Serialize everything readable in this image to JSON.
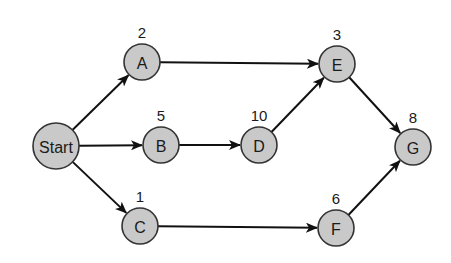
{
  "diagram": {
    "type": "activity-network",
    "nodes": [
      {
        "id": "start",
        "label": "Start",
        "duration": "",
        "x": 56,
        "y": 146,
        "r": 23
      },
      {
        "id": "A",
        "label": "A",
        "duration": "2",
        "x": 142,
        "y": 62,
        "r": 18
      },
      {
        "id": "B",
        "label": "B",
        "duration": "5",
        "x": 161,
        "y": 145,
        "r": 18
      },
      {
        "id": "C",
        "label": "C",
        "duration": "1",
        "x": 140,
        "y": 226,
        "r": 18
      },
      {
        "id": "D",
        "label": "D",
        "duration": "10",
        "x": 259,
        "y": 145,
        "r": 18
      },
      {
        "id": "E",
        "label": "E",
        "duration": "3",
        "x": 337,
        "y": 64,
        "r": 18
      },
      {
        "id": "F",
        "label": "F",
        "duration": "6",
        "x": 336,
        "y": 228,
        "r": 18
      },
      {
        "id": "G",
        "label": "G",
        "duration": "8",
        "x": 413,
        "y": 147,
        "r": 18
      }
    ],
    "edges": [
      {
        "from": "start",
        "to": "A"
      },
      {
        "from": "start",
        "to": "B"
      },
      {
        "from": "start",
        "to": "C"
      },
      {
        "from": "A",
        "to": "E"
      },
      {
        "from": "B",
        "to": "D"
      },
      {
        "from": "D",
        "to": "E"
      },
      {
        "from": "C",
        "to": "F"
      },
      {
        "from": "E",
        "to": "G"
      },
      {
        "from": "F",
        "to": "G"
      }
    ],
    "colors": {
      "node_fill": "#c9c9c9",
      "node_stroke": "#333333",
      "edge": "#111111",
      "text": "#1a1a1a"
    }
  }
}
